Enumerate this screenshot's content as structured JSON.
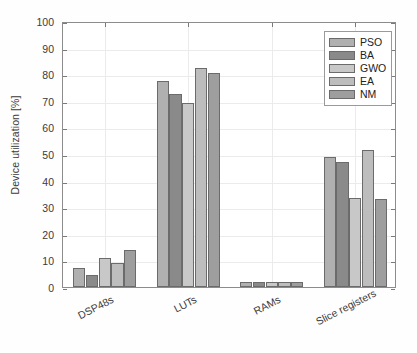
{
  "chart_data": {
    "type": "bar",
    "title": "",
    "xlabel": "",
    "ylabel": "Device utilization [%]",
    "categories": [
      "DSP48s",
      "LUTs",
      "RAMs",
      "Slice registers"
    ],
    "series": [
      {
        "name": "PSO",
        "color": "#b0b0b0",
        "values": [
          7.0,
          77.5,
          2.0,
          49.0
        ]
      },
      {
        "name": "BA",
        "color": "#8a8a8a",
        "values": [
          4.5,
          72.5,
          2.0,
          47.0
        ]
      },
      {
        "name": "GWO",
        "color": "#c8c8c8",
        "values": [
          11.0,
          69.0,
          2.0,
          33.5
        ]
      },
      {
        "name": "EA",
        "color": "#bdbdbd",
        "values": [
          9.0,
          82.5,
          2.0,
          51.5
        ]
      },
      {
        "name": "NM",
        "color": "#9e9e9e",
        "values": [
          14.0,
          80.5,
          2.0,
          33.0
        ]
      }
    ],
    "ylim": [
      0,
      100
    ],
    "yticks": [
      0,
      10,
      20,
      30,
      40,
      50,
      60,
      70,
      80,
      90,
      100
    ],
    "ytick_labels": [
      "0",
      "10",
      "20",
      "30",
      "40",
      "50",
      "60",
      "70",
      "80",
      "90",
      "100"
    ],
    "grid": true,
    "legend_position": "top-right",
    "legend_entries": [
      "PSO",
      "BA",
      "GWO",
      "EA",
      "NM"
    ]
  }
}
